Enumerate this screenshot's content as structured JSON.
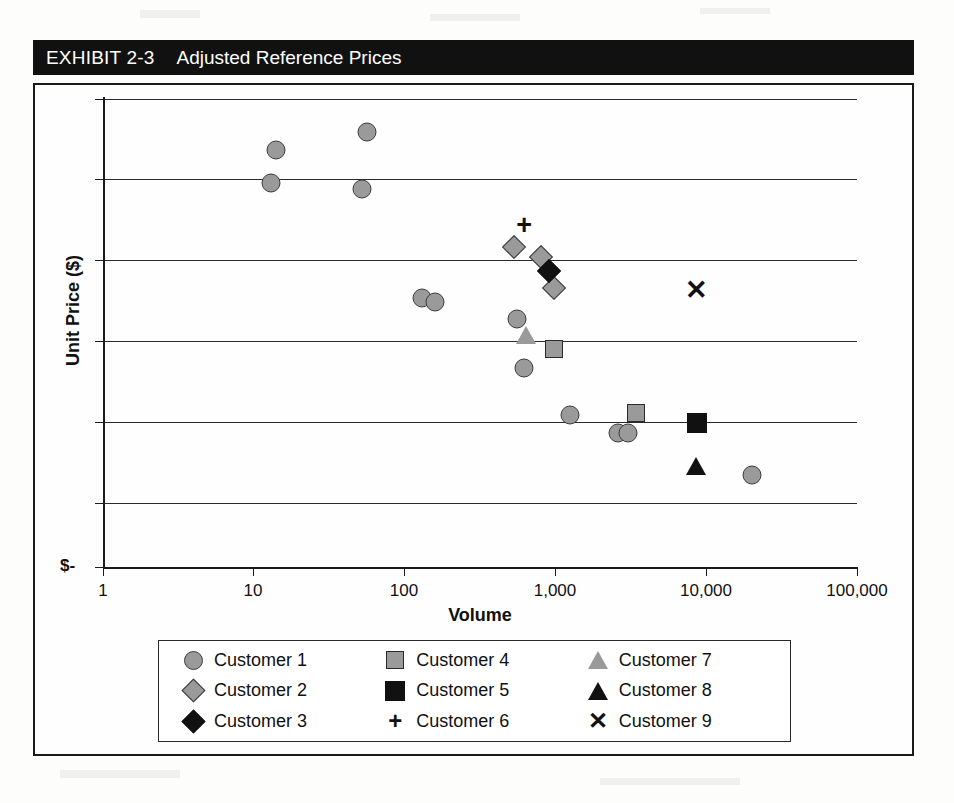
{
  "exhibit": {
    "number": "EXHIBIT 2-3",
    "title": "Adjusted Reference Prices"
  },
  "chart_data": {
    "type": "scatter",
    "title": "Adjusted Reference Prices",
    "xlabel": "Volume",
    "ylabel": "Unit Price ($)",
    "xscale": "log",
    "xlim": [
      1,
      100000
    ],
    "xticklabels": [
      "1",
      "10",
      "100",
      "1,000",
      "10,000",
      "100,000"
    ],
    "xtickvalues": [
      1,
      10,
      100,
      1000,
      10000,
      100000
    ],
    "ylim": [
      0,
      6
    ],
    "yticklabels": [
      "$-",
      "",
      "",
      "",
      "",
      "",
      ""
    ],
    "ytickvalues": [
      0,
      1,
      2,
      3,
      4,
      5,
      6
    ],
    "grid": "horizontal",
    "legend_position": "below-axes",
    "series": [
      {
        "name": "Customer 1",
        "marker": "circle",
        "color": "#9a9a9a",
        "points": [
          {
            "x": 14,
            "y": 5.35
          },
          {
            "x": 13,
            "y": 4.92
          },
          {
            "x": 56,
            "y": 5.58
          },
          {
            "x": 52,
            "y": 4.85
          },
          {
            "x": 130,
            "y": 3.45
          },
          {
            "x": 158,
            "y": 3.4
          },
          {
            "x": 560,
            "y": 3.18
          },
          {
            "x": 620,
            "y": 2.55
          },
          {
            "x": 1250,
            "y": 1.95
          },
          {
            "x": 2600,
            "y": 1.72
          },
          {
            "x": 3050,
            "y": 1.72
          },
          {
            "x": 20000,
            "y": 1.18
          }
        ]
      },
      {
        "name": "Customer 2",
        "marker": "diamond",
        "color": "#9a9a9a",
        "points": [
          {
            "x": 530,
            "y": 4.1
          },
          {
            "x": 800,
            "y": 3.98
          },
          {
            "x": 980,
            "y": 3.58
          }
        ]
      },
      {
        "name": "Customer 3",
        "marker": "diamond-filled",
        "color": "#111111",
        "points": [
          {
            "x": 900,
            "y": 3.8
          }
        ]
      },
      {
        "name": "Customer 4",
        "marker": "square",
        "color": "#9a9a9a",
        "points": [
          {
            "x": 980,
            "y": 2.8
          },
          {
            "x": 3400,
            "y": 1.98
          }
        ]
      },
      {
        "name": "Customer 5",
        "marker": "square-filled",
        "color": "#111111",
        "points": [
          {
            "x": 8700,
            "y": 1.85
          }
        ]
      },
      {
        "name": "Customer 6",
        "marker": "plus",
        "color": "#111111",
        "points": [
          {
            "x": 620,
            "y": 4.38
          }
        ]
      },
      {
        "name": "Customer 7",
        "marker": "triangle",
        "color": "#9a9a9a",
        "points": [
          {
            "x": 640,
            "y": 2.98
          }
        ]
      },
      {
        "name": "Customer 8",
        "marker": "triangle-filled",
        "color": "#111111",
        "points": [
          {
            "x": 8500,
            "y": 1.3
          }
        ]
      },
      {
        "name": "Customer 9",
        "marker": "x",
        "color": "#111111",
        "points": [
          {
            "x": 8500,
            "y": 3.55
          }
        ]
      }
    ]
  },
  "axes": {
    "y_zero_label": "$-",
    "y_title": "Unit Price ($)",
    "x_title": "Volume",
    "x_labels": [
      "1",
      "10",
      "100",
      "1,000",
      "10,000",
      "100,000"
    ]
  },
  "legend": {
    "entries": [
      {
        "label": "Customer 1",
        "marker": "circle"
      },
      {
        "label": "Customer 4",
        "marker": "square"
      },
      {
        "label": "Customer 7",
        "marker": "triangle"
      },
      {
        "label": "Customer 2",
        "marker": "diamond"
      },
      {
        "label": "Customer 5",
        "marker": "square-filled"
      },
      {
        "label": "Customer 8",
        "marker": "triangle-filled"
      },
      {
        "label": "Customer 3",
        "marker": "diamond-filled"
      },
      {
        "label": "Customer 6",
        "marker": "plus"
      },
      {
        "label": "Customer 9",
        "marker": "x"
      }
    ]
  },
  "glyphs": {
    "plus": "+",
    "x": "✕"
  },
  "colors": {
    "gray_marker": "#9a9a9a",
    "black_marker": "#111111",
    "title_bar_bg": "#111111",
    "title_bar_fg": "#ffffff",
    "frame": "#1a1a1a"
  }
}
